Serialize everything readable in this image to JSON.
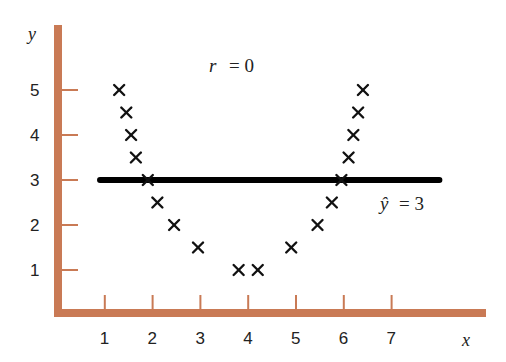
{
  "chart_data": {
    "type": "scatter",
    "title": "",
    "xlabel": "x",
    "ylabel": "y",
    "x_ticks": [
      1,
      2,
      3,
      4,
      5,
      6,
      7
    ],
    "y_ticks": [
      1,
      2,
      3,
      4,
      5
    ],
    "xlim": [
      0,
      9
    ],
    "ylim": [
      0,
      6
    ],
    "grid": false,
    "legend": null,
    "marker": "x",
    "series": [
      {
        "name": "data",
        "points": [
          {
            "x": 1.3,
            "y": 5.0
          },
          {
            "x": 1.45,
            "y": 4.5
          },
          {
            "x": 1.55,
            "y": 4.0
          },
          {
            "x": 1.65,
            "y": 3.5
          },
          {
            "x": 1.9,
            "y": 3.0
          },
          {
            "x": 2.1,
            "y": 2.5
          },
          {
            "x": 2.45,
            "y": 2.0
          },
          {
            "x": 2.95,
            "y": 1.5
          },
          {
            "x": 3.8,
            "y": 1.0
          },
          {
            "x": 4.2,
            "y": 1.0
          },
          {
            "x": 4.9,
            "y": 1.5
          },
          {
            "x": 5.45,
            "y": 2.0
          },
          {
            "x": 5.75,
            "y": 2.5
          },
          {
            "x": 5.95,
            "y": 3.0
          },
          {
            "x": 6.1,
            "y": 3.5
          },
          {
            "x": 6.2,
            "y": 4.0
          },
          {
            "x": 6.3,
            "y": 4.5
          },
          {
            "x": 6.4,
            "y": 5.0
          }
        ]
      }
    ],
    "regression_line": {
      "label": "ŷ = 3",
      "y": 3,
      "x_start": 0.9,
      "x_end": 8.0
    },
    "annotations": [
      {
        "text": "r = 0",
        "x": 4.1,
        "y": 5.5
      },
      {
        "text": "ŷ = 3",
        "x": 7.5,
        "y": 2.6
      }
    ],
    "colors": {
      "axes": "#c97a55",
      "markers": "#111111",
      "line": "#000000"
    }
  },
  "labels": {
    "x_axis": "x",
    "y_axis": "y",
    "r_label": "r",
    "r_eq": "= 0",
    "yhat_label": "ŷ",
    "yhat_eq": "= 3",
    "x_tick_labels": [
      "1",
      "2",
      "3",
      "4",
      "5",
      "6",
      "7"
    ],
    "y_tick_labels": [
      "1",
      "2",
      "3",
      "4",
      "5"
    ]
  }
}
